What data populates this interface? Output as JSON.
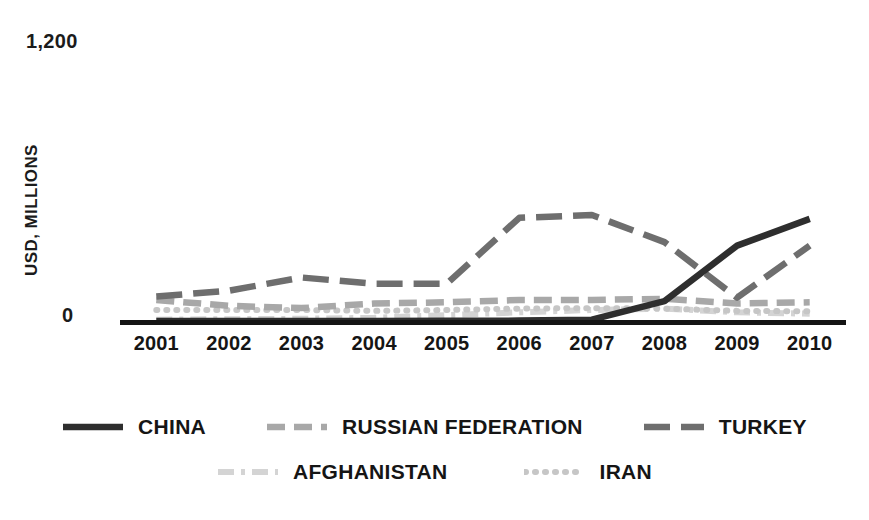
{
  "chart_data": {
    "type": "line",
    "title": "",
    "subtitle": "",
    "xlabel": "",
    "ylabel": "USD, MILLIONS",
    "x": [
      "2001",
      "2002",
      "2003",
      "2004",
      "2005",
      "2006",
      "2007",
      "2008",
      "2009",
      "2010"
    ],
    "ylim": [
      0,
      1200
    ],
    "yticks": [
      0,
      1200
    ],
    "ytick_labels": [
      "0",
      "1,200"
    ],
    "grid": false,
    "legend_position": "bottom",
    "series": [
      {
        "name": "CHINA",
        "color": "#2e2e2e",
        "style": "solid-thick",
        "values": [
          4,
          4,
          4,
          4,
          5,
          6,
          10,
          90,
          330,
          445
        ]
      },
      {
        "name": "RUSSIAN FEDERATION",
        "color": "#a8a8a8",
        "style": "dashed",
        "values": [
          95,
          70,
          60,
          80,
          85,
          95,
          95,
          100,
          80,
          85
        ]
      },
      {
        "name": "TURKEY",
        "color": "#6e6e6e",
        "style": "dash-dash",
        "values": [
          110,
          135,
          192,
          165,
          165,
          450,
          462,
          345,
          105,
          330
        ]
      },
      {
        "name": "AFGHANISTAN",
        "color": "#d4d4d4",
        "style": "dash-dot",
        "values": [
          10,
          12,
          14,
          18,
          30,
          42,
          52,
          58,
          42,
          36
        ]
      },
      {
        "name": "IRAN",
        "color": "#c6c6c6",
        "style": "dotted",
        "values": [
          52,
          52,
          52,
          48,
          52,
          58,
          60,
          58,
          48,
          46
        ]
      }
    ]
  },
  "axis": {
    "y_top_label": "1,200",
    "y_zero_label": "0",
    "y_title": "USD, MILLIONS"
  },
  "legend": {
    "row1": [
      {
        "label": "CHINA",
        "swatch": "line-swatch-solid-dark"
      },
      {
        "label": "RUSSIAN FEDERATION",
        "swatch": "line-swatch-dashed-light"
      },
      {
        "label": "TURKEY",
        "swatch": "line-swatch-dashed-medium"
      }
    ],
    "row2": [
      {
        "label": "AFGHANISTAN",
        "swatch": "line-swatch-dashdot-pale"
      },
      {
        "label": "IRAN",
        "swatch": "line-swatch-dotted-pale"
      }
    ]
  },
  "colors": {
    "china": "#2e2e2e",
    "russian_federation": "#a8a8a8",
    "turkey": "#6e6e6e",
    "afghanistan": "#d4d4d4",
    "iran": "#c6c6c6",
    "axis": "#1a1a1a",
    "background": "#ffffff"
  }
}
